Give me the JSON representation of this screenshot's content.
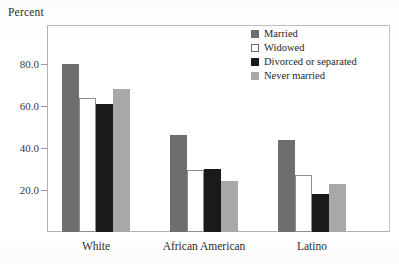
{
  "chart_data": {
    "type": "bar",
    "title": "",
    "ylabel": "Percent",
    "xlabel": "",
    "categories": [
      "White",
      "African American",
      "Latino"
    ],
    "series": [
      {
        "name": "Married",
        "color": "#6e6e6e",
        "values": [
          80.0,
          46.0,
          44.0
        ]
      },
      {
        "name": "Widowed",
        "color": "#ffffff",
        "values": [
          64.0,
          29.5,
          27.0
        ]
      },
      {
        "name": "Divorced or separated",
        "color": "#1a1a1a",
        "values": [
          61.0,
          30.0,
          18.0
        ]
      },
      {
        "name": "Never married",
        "color": "#a8a8a8",
        "values": [
          68.0,
          24.5,
          23.0
        ]
      }
    ],
    "ylim": [
      0,
      92
    ],
    "yticks": [
      20.0,
      40.0,
      60.0,
      80.0
    ],
    "ytick_labels": [
      "20.0",
      "40.0",
      "60.0",
      "80.0"
    ],
    "grid": false,
    "legend_position": "top-right-inside",
    "legend_entries": [
      "Married",
      "Widowed",
      "Divorced or separated",
      "Never married"
    ],
    "frame": true
  }
}
